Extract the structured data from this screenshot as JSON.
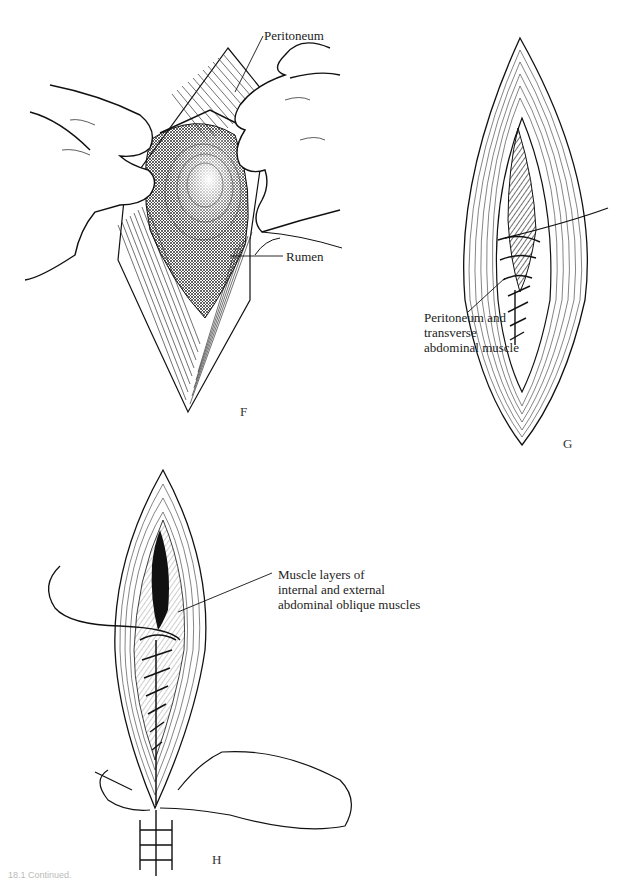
{
  "figure": {
    "panels": [
      {
        "id": "F",
        "letter": "F",
        "labels": [
          {
            "text": "Peritoneum"
          },
          {
            "text": "Rumen"
          }
        ]
      },
      {
        "id": "G",
        "letter": "G",
        "labels": [
          {
            "lines": [
              "Peritoneum and",
              "transverse",
              "abdominal muscle"
            ]
          }
        ]
      },
      {
        "id": "H",
        "letter": "H",
        "labels": [
          {
            "lines": [
              "Muscle layers of",
              "internal and external",
              "abdominal oblique muscles"
            ]
          }
        ]
      }
    ],
    "caption": "18.1 Continued."
  },
  "colors": {
    "ink": "#1a1a1a",
    "background": "#ffffff",
    "shade": "#555555"
  }
}
